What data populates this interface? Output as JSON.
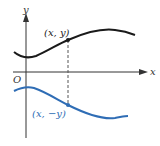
{
  "diagram": {
    "axes": {
      "x_label": "x",
      "y_label": "y",
      "origin_label": "O"
    },
    "points": [
      {
        "label": "(x, y)",
        "color": "#1a1a1a"
      },
      {
        "label": "(x, −y)",
        "color": "#2f6db5"
      }
    ],
    "curves": [
      {
        "name": "original",
        "color": "#1a1a1a"
      },
      {
        "name": "reflected",
        "color": "#2f6db5"
      }
    ],
    "colors": {
      "axis": "#333333",
      "black_curve": "#1a1a1a",
      "blue_curve": "#2f6db5",
      "dashed_line": "#555555"
    }
  }
}
